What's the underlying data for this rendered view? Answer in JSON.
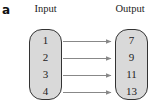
{
  "panel_label": "a",
  "input": {
    "title": "Input",
    "values": [
      "1",
      "2",
      "3",
      "4"
    ]
  },
  "output": {
    "title": "Output",
    "values": [
      "7",
      "9",
      "11",
      "13"
    ]
  },
  "colors": {
    "box_fill": "#d9d9d9",
    "box_stroke": "#333333",
    "arrow": "#888888"
  }
}
